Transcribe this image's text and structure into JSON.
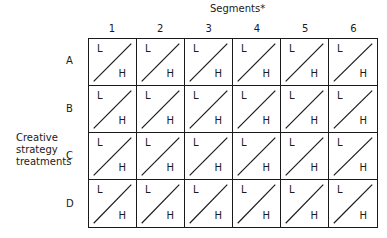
{
  "title": "Segments*",
  "side_label": [
    "Creative",
    "strategy",
    "treatments"
  ],
  "columns": [
    "1",
    "2",
    "3",
    "4",
    "5",
    "6"
  ],
  "rows": [
    "A",
    "B",
    "C",
    "D"
  ],
  "cell": {
    "low": "L",
    "high": "H"
  }
}
